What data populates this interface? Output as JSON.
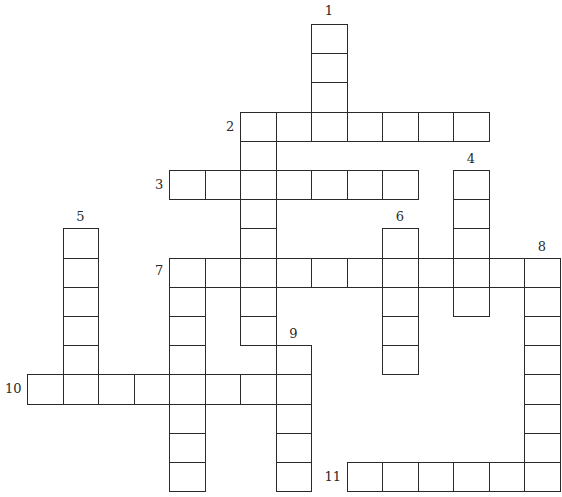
{
  "puzzle": {
    "type": "crossword",
    "grid": {
      "origin_x": 27,
      "origin_y": 24,
      "cell_w": 35.5,
      "cell_h": 29.2
    },
    "entries": [
      {
        "number": "1",
        "direction": "down",
        "col": 8,
        "row": 0,
        "length": 4,
        "label_dx": 0,
        "label_dy": -20
      },
      {
        "number": "2",
        "direction": "across",
        "col": 6,
        "row": 3,
        "length": 7,
        "label_dx": -14,
        "label_dy": 8
      },
      {
        "number": "2",
        "direction": "down",
        "col": 6,
        "row": 3,
        "length": 8,
        "label_dx": null,
        "label_dy": null
      },
      {
        "number": "3",
        "direction": "across",
        "col": 4,
        "row": 5,
        "length": 7,
        "label_dx": -14,
        "label_dy": 8
      },
      {
        "number": "4",
        "direction": "down",
        "col": 12,
        "row": 5,
        "length": 5,
        "label_dx": 0,
        "label_dy": -18
      },
      {
        "number": "5",
        "direction": "down",
        "col": 1,
        "row": 7,
        "length": 6,
        "label_dx": 0,
        "label_dy": -18
      },
      {
        "number": "6",
        "direction": "down",
        "col": 10,
        "row": 7,
        "length": 5,
        "label_dx": 0,
        "label_dy": -18
      },
      {
        "number": "7",
        "direction": "across",
        "col": 4,
        "row": 8,
        "length": 11,
        "label_dx": -14,
        "label_dy": 6
      },
      {
        "number": "7",
        "direction": "down",
        "col": 4,
        "row": 8,
        "length": 8,
        "label_dx": null,
        "label_dy": null
      },
      {
        "number": "8",
        "direction": "down",
        "col": 14,
        "row": 8,
        "length": 8,
        "label_dx": 0,
        "label_dy": -18
      },
      {
        "number": "9",
        "direction": "down",
        "col": 7,
        "row": 11,
        "length": 5,
        "label_dx": 0,
        "label_dy": -18
      },
      {
        "number": "10",
        "direction": "across",
        "col": 0,
        "row": 12,
        "length": 8,
        "label_dx": -22,
        "label_dy": 8
      },
      {
        "number": "11",
        "direction": "across",
        "col": 9,
        "row": 15,
        "length": 6,
        "label_dx": -22,
        "label_dy": 8
      }
    ]
  }
}
